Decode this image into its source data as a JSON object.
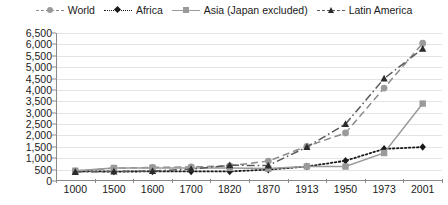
{
  "chart_data": {
    "type": "line",
    "title": "",
    "subtitle": "",
    "xlabel": "",
    "ylabel": "",
    "categories": [
      "1000",
      "1500",
      "1600",
      "1700",
      "1820",
      "1870",
      "1913",
      "1950",
      "1973",
      "2001"
    ],
    "ylim": [
      0,
      6500
    ],
    "ytick_step": 500,
    "ytick_labels": [
      "0",
      "500",
      "1,000",
      "1,500",
      "2,000",
      "2,500",
      "3,000",
      "3,500",
      "4,000",
      "4,500",
      "5,000",
      "5,500",
      "6,000",
      "6,500"
    ],
    "ytick_values": [
      0,
      500,
      1000,
      1500,
      2000,
      2500,
      3000,
      3500,
      4000,
      4500,
      5000,
      5500,
      6000,
      6500
    ],
    "grid": true,
    "legend_position": "top",
    "series": [
      {
        "name": "World",
        "marker": "circle",
        "line_style": "dashed",
        "color": "#8c8c8c",
        "marker_color": "#9a9a9a",
        "values": [
          435,
          565,
          595,
          615,
          665,
          875,
          1525,
          2110,
          4080,
          6050
        ]
      },
      {
        "name": "Africa",
        "marker": "diamond",
        "line_style": "dotted",
        "color": "#1a1a1a",
        "marker_color": "#1a1a1a",
        "values": [
          425,
          415,
          420,
          420,
          420,
          500,
          635,
          890,
          1410,
          1490
        ]
      },
      {
        "name": "Asia (Japan excluded)",
        "marker": "square",
        "line_style": "solid",
        "color": "#9a9a9a",
        "marker_color": "#9a9a9a",
        "values": [
          450,
          570,
          575,
          570,
          575,
          545,
          640,
          635,
          1230,
          3400
        ]
      },
      {
        "name": "Latin America",
        "marker": "triangle",
        "line_style": "dashdot",
        "color": "#5a5a5a",
        "marker_color": "#2b2b2b",
        "values": [
          400,
          415,
          440,
          525,
          690,
          680,
          1490,
          2500,
          4500,
          5810
        ]
      }
    ]
  }
}
